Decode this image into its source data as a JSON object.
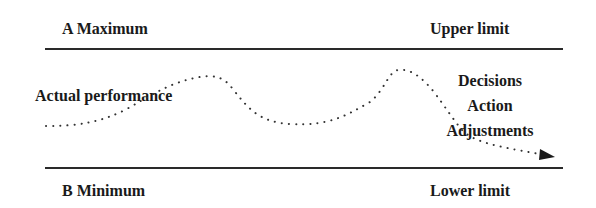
{
  "diagram": {
    "top": {
      "left_label": "A Maximum",
      "right_label": "Upper limit"
    },
    "bottom": {
      "left_label": "B Minimum",
      "right_label": "Lower limit"
    },
    "curve_label": "Actual performance",
    "control_labels": [
      "Decisions",
      "Action",
      "Adjustments"
    ],
    "colors": {
      "text": "#1a1a1a",
      "line": "#2a2a2a",
      "dots": "#333333"
    }
  }
}
